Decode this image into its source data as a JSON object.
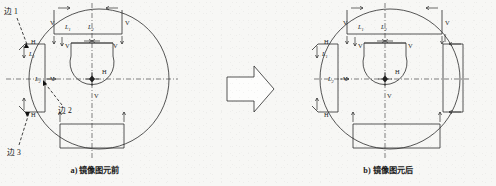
{
  "figure": {
    "kind": "cad-mirror-diagram",
    "background_color": "#f7f7f5",
    "line_color": "#2b2b2b",
    "panels": [
      {
        "id": "before",
        "caption": "a) 镜像图元前",
        "center_marker": "origin-node",
        "edge_callouts": [
          {
            "label": "边 1",
            "target": "upper-left-edge"
          },
          {
            "label": "边 2",
            "target": "mid-left-edge"
          },
          {
            "label": "边 3",
            "target": "lower-left-edge"
          }
        ],
        "dimension_labels": [
          {
            "text": "L",
            "sub": "1",
            "where": "top-rect-left"
          },
          {
            "text": "L",
            "sub": "2",
            "where": "top-rect-center"
          },
          {
            "text": "L",
            "sub": "1",
            "where": "left-rect-upper"
          },
          {
            "text": "L",
            "sub": "2",
            "where": "left-rect-axis"
          }
        ],
        "constraint_marks": [
          {
            "text": "V",
            "where": "top-rect-left-side"
          },
          {
            "text": "V",
            "where": "top-rect-right-side"
          },
          {
            "text": "V",
            "where": "keyhole-left-outer"
          },
          {
            "text": "V",
            "where": "keyhole-left-inner"
          },
          {
            "text": "V",
            "where": "keyhole-right-inner"
          },
          {
            "text": "V",
            "where": "keyhole-right-outer"
          },
          {
            "text": "V",
            "where": "left-axis-node"
          },
          {
            "text": "V",
            "where": "keyhole-bottom"
          },
          {
            "text": "H",
            "where": "upper-left-corner"
          },
          {
            "text": "H",
            "where": "lower-left-corner"
          },
          {
            "text": "H",
            "where": "keyhole-top"
          },
          {
            "text": "H",
            "where": "center-right"
          }
        ]
      },
      {
        "id": "after",
        "caption": "b) 镜像图元后",
        "center_marker": "origin-node",
        "edge_callouts": [],
        "dimension_labels": [
          {
            "text": "L",
            "sub": "1",
            "where": "top-rect-left"
          },
          {
            "text": "L",
            "sub": "2",
            "where": "top-rect-center"
          },
          {
            "text": "L",
            "sub": "1",
            "where": "left-rect-upper"
          },
          {
            "text": "L",
            "sub": "2",
            "where": "left-rect-axis"
          }
        ],
        "constraint_marks": [
          {
            "text": "V",
            "where": "top-rect-left-side"
          },
          {
            "text": "V",
            "where": "top-rect-right-side"
          },
          {
            "text": "V",
            "where": "keyhole-left-inner"
          },
          {
            "text": "V",
            "where": "keyhole-right-inner"
          },
          {
            "text": "V",
            "where": "left-axis-node"
          },
          {
            "text": "V",
            "where": "keyhole-bottom"
          },
          {
            "text": "H",
            "where": "upper-left-corner"
          },
          {
            "text": "H",
            "where": "lower-left-corner"
          },
          {
            "text": "H",
            "where": "keyhole-top"
          },
          {
            "text": "H",
            "where": "center-right"
          }
        ],
        "mirrored_feature": "right-side-rectangle"
      }
    ],
    "transition": {
      "icon": "right-arrow-icon",
      "direction": "right"
    }
  }
}
